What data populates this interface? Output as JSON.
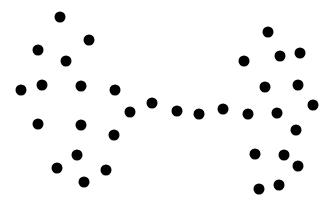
{
  "diagram": {
    "type": "barbell-graph-nodes",
    "node_color": "#000000",
    "background": "#ffffff",
    "node_radius": 5.5,
    "nodes": [
      {
        "x": 60,
        "y": 17
      },
      {
        "x": 89,
        "y": 40
      },
      {
        "x": 38,
        "y": 50
      },
      {
        "x": 66,
        "y": 61
      },
      {
        "x": 42,
        "y": 85
      },
      {
        "x": 21,
        "y": 90
      },
      {
        "x": 81,
        "y": 86
      },
      {
        "x": 115,
        "y": 90
      },
      {
        "x": 152,
        "y": 103
      },
      {
        "x": 130,
        "y": 112
      },
      {
        "x": 38,
        "y": 124
      },
      {
        "x": 81,
        "y": 125
      },
      {
        "x": 114,
        "y": 135
      },
      {
        "x": 77,
        "y": 155
      },
      {
        "x": 57,
        "y": 168
      },
      {
        "x": 106,
        "y": 170
      },
      {
        "x": 84,
        "y": 182
      },
      {
        "x": 177,
        "y": 111
      },
      {
        "x": 199,
        "y": 114
      },
      {
        "x": 223,
        "y": 109
      },
      {
        "x": 248,
        "y": 114
      },
      {
        "x": 268,
        "y": 32
      },
      {
        "x": 244,
        "y": 61
      },
      {
        "x": 280,
        "y": 56
      },
      {
        "x": 300,
        "y": 53
      },
      {
        "x": 265,
        "y": 87
      },
      {
        "x": 298,
        "y": 85
      },
      {
        "x": 277,
        "y": 113
      },
      {
        "x": 313,
        "y": 105
      },
      {
        "x": 296,
        "y": 130
      },
      {
        "x": 255,
        "y": 154
      },
      {
        "x": 284,
        "y": 155
      },
      {
        "x": 298,
        "y": 166
      },
      {
        "x": 259,
        "y": 189
      },
      {
        "x": 279,
        "y": 185
      }
    ]
  }
}
